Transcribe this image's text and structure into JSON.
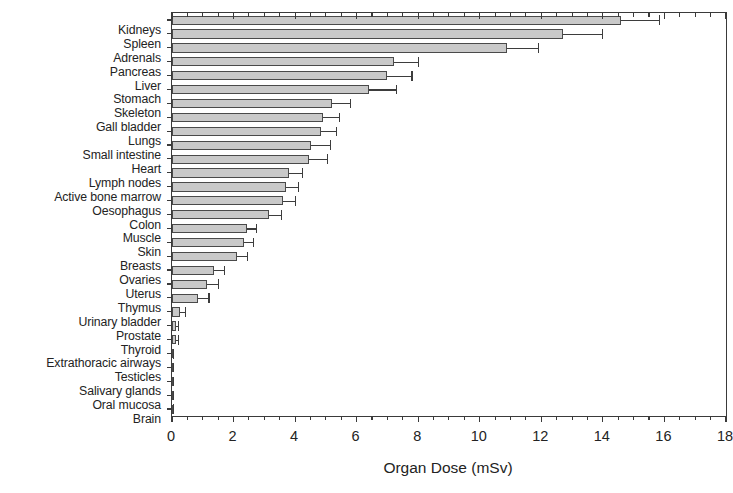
{
  "chart_data": {
    "type": "bar",
    "orientation": "horizontal",
    "title": "",
    "xlabel": "Organ Dose (mSv)",
    "ylabel": "",
    "xlim": [
      0,
      18
    ],
    "xticks": [
      0,
      2,
      4,
      6,
      8,
      10,
      12,
      14,
      16,
      18
    ],
    "xtick_labels": [
      "0",
      "2",
      "4",
      "6",
      "8",
      "10",
      "12",
      "14",
      "16",
      "18"
    ],
    "minor_tick_step": 0.5,
    "grid": false,
    "legend": null,
    "bar_color": "#c9c9c9",
    "bar_edge_color": "#4a4a4a",
    "error_bar_color": "#3d3d3d",
    "axis_color": "#3a3a3a",
    "error_bars": "upper only",
    "categories": [
      "Kidneys",
      "Spleen",
      "Adrenals",
      "Pancreas",
      "Liver",
      "Stomach",
      "Skeleton",
      "Gall bladder",
      "Lungs",
      "Small intestine",
      "Heart",
      "Lymph nodes",
      "Active bone marrow",
      "Oesophagus",
      "Colon",
      "Muscle",
      "Skin",
      "Breasts",
      "Ovaries",
      "Uterus",
      "Thymus",
      "Urinary bladder",
      "Prostate",
      "Thyroid",
      "Extrathoracic airways",
      "Testicles",
      "Salivary glands",
      "Oral mucosa",
      "Brain"
    ],
    "values": [
      14.6,
      12.7,
      10.9,
      7.2,
      7.0,
      6.4,
      5.2,
      4.9,
      4.85,
      4.5,
      4.45,
      3.8,
      3.7,
      3.6,
      3.15,
      2.45,
      2.35,
      2.1,
      1.35,
      1.15,
      0.85,
      0.25,
      0.12,
      0.12,
      0.04,
      0.04,
      0.03,
      0.03,
      0.03
    ],
    "error_upper": [
      15.85,
      14.0,
      11.9,
      8.0,
      7.8,
      7.3,
      5.8,
      5.45,
      5.35,
      5.15,
      5.05,
      4.25,
      4.1,
      4.0,
      3.55,
      2.75,
      2.65,
      2.45,
      1.7,
      1.5,
      1.2,
      0.45,
      0.2,
      0.2,
      0.06,
      0.06,
      0.04,
      0.04,
      0.04
    ]
  }
}
